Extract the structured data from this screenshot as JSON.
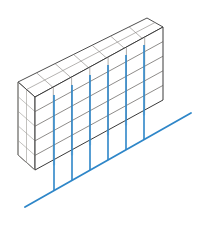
{
  "canvas": {
    "width": 199,
    "height": 230,
    "background": "#ffffff",
    "title": "Isometric modular wall with vertical blue guide lines"
  },
  "palette": {
    "outline_dark": "#3a3a3a",
    "grid_light": "#b8b5b0",
    "grid_mid": "#8d8a86",
    "blue_line": "#2e86c8",
    "blue_ground": "#2e86c8",
    "blue_fade": "#9ecbe8",
    "background": "#ffffff"
  },
  "structure": {
    "name": "isometric-wall-block",
    "columns": 7,
    "rows": 5,
    "depth_units": 2,
    "faces": [
      {
        "name": "top-face",
        "visible": true,
        "grid": "7x2"
      },
      {
        "name": "front-face",
        "visible": true,
        "grid": "7x5"
      },
      {
        "name": "left-end-face",
        "visible": true,
        "grid": "2x5"
      }
    ],
    "geometry": {
      "front_top_left": [
        35,
        97
      ],
      "front_top_right": [
        163,
        27
      ],
      "front_bottom_left": [
        35,
        170
      ],
      "front_bottom_right": [
        163,
        100
      ],
      "back_top_left": [
        18,
        82
      ],
      "back_top_right": [
        147,
        18
      ],
      "back_bottom_left": [
        18,
        155
      ],
      "depth_offset": [
        -17,
        -14
      ],
      "row_height": 14.6,
      "column_step": [
        18.28,
        -10.0
      ]
    }
  },
  "guide_lines": {
    "name": "blue-vertical-guides",
    "count": 6,
    "color": "#2e86c8",
    "stroke_width": 1.6,
    "lines": [
      {
        "id": "guide-1",
        "x_top": 54,
        "y_top": 95,
        "x_bottom": 54,
        "y_bottom": 190
      },
      {
        "id": "guide-2",
        "x_top": 72,
        "y_top": 85,
        "x_bottom": 72,
        "y_bottom": 180
      },
      {
        "id": "guide-3",
        "x_top": 90,
        "y_top": 75,
        "x_bottom": 90,
        "y_bottom": 170
      },
      {
        "id": "guide-4",
        "x_top": 108,
        "y_top": 65,
        "x_bottom": 108,
        "y_bottom": 160
      },
      {
        "id": "guide-5",
        "x_top": 126,
        "y_top": 55,
        "x_bottom": 126,
        "y_bottom": 150
      },
      {
        "id": "guide-6",
        "x_top": 144,
        "y_top": 45,
        "x_bottom": 144,
        "y_bottom": 140
      }
    ]
  },
  "ground_line": {
    "name": "blue-ground-axis",
    "color": "#2e86c8",
    "stroke_width": 1.8,
    "start": [
      25,
      207
    ],
    "end": [
      191,
      113
    ]
  },
  "labels": {
    "caption": "",
    "annotations": []
  }
}
